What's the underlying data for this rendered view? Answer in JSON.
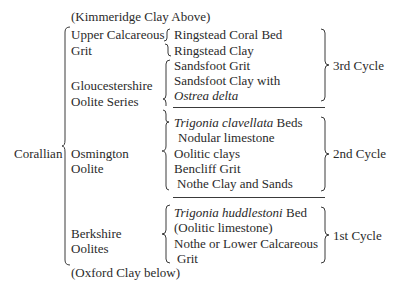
{
  "table": {
    "above": "(Kimmeridge Clay Above)",
    "below": "(Oxford Clay below)",
    "group": "Corallian",
    "formations": [
      {
        "name_line1": "Upper Calcareous",
        "name_line2": "Grit"
      },
      {
        "name_line1": "Gloucestershire",
        "name_line2": "Oolite Series"
      },
      {
        "name_line1": "Osmington",
        "name_line2": "Oolite"
      },
      {
        "name_line1": "Berkshire",
        "name_line2": "Oolites"
      }
    ],
    "beds": {
      "ringstead_coral": "Ringstead Coral Bed",
      "ringstead_clay": "Ringstead Clay",
      "sandsfoot_grit": "Sandsfoot Grit",
      "sandsfoot_clay": "Sandsfoot Clay with",
      "ostrea": "Ostrea delta",
      "trig_clav_italic": "Trigonia clavellata",
      "trig_clav_rest": " Beds",
      "nodular": "Nodular limestone",
      "oolitic_clays": "Oolitic clays",
      "bencliff": "Bencliff Grit",
      "nothe_clay": "Nothe Clay and Sands",
      "trig_hudd_italic": "Trigonia huddlestoni",
      "trig_hudd_rest": " Bed",
      "oolitic_ls": "(Oolitic limestone)",
      "nothe_lower": "Nothe or Lower Calcareous",
      "grit": "Grit"
    },
    "cycles": [
      "3rd Cycle",
      "2nd Cycle",
      "1st Cycle"
    ]
  }
}
